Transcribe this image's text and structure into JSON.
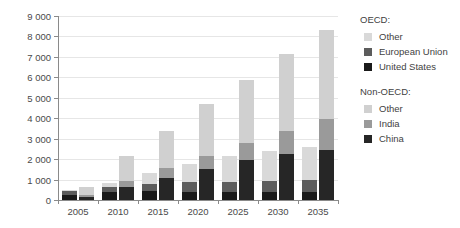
{
  "chart_data": {
    "type": "bar",
    "subtype": "stacked-grouped",
    "title": "",
    "xlabel": "",
    "ylabel": "Billion tonne-km",
    "categories": [
      "2005",
      "2010",
      "2015",
      "2020",
      "2025",
      "2030",
      "2035"
    ],
    "ylim": [
      0,
      9000
    ],
    "ytick_step": 1000,
    "yticks": [
      0,
      1000,
      2000,
      3000,
      4000,
      5000,
      6000,
      7000,
      8000,
      9000
    ],
    "ytick_labels": [
      "0",
      "1 000",
      "2 000",
      "3 000",
      "4 000",
      "5 000",
      "6 000",
      "7 000",
      "8 000",
      "9 000"
    ],
    "grid": true,
    "legend_position": "right",
    "groups": [
      {
        "name": "OECD",
        "bar_position": "left",
        "series": [
          {
            "name": "United States",
            "color": "#1a1a1a",
            "values": [
              260,
              370,
              420,
              380,
              380,
              390,
              400
            ]
          },
          {
            "name": "European Union",
            "color": "#5c5c5c",
            "values": [
              430,
              650,
              800,
              860,
              900,
              950,
              1000
            ]
          },
          {
            "name": "Other",
            "color": "#d9d9d9",
            "values": [
              480,
              840,
              1300,
              1750,
              2130,
              2380,
              2600
            ]
          }
        ]
      },
      {
        "name": "Non-OECD",
        "bar_position": "right",
        "series": [
          {
            "name": "China",
            "color": "#262626",
            "values": [
              160,
              620,
              1080,
              1510,
              1950,
              2230,
              2450
            ]
          },
          {
            "name": "India",
            "color": "#9a9a9a",
            "values": [
              230,
              950,
              1580,
              2130,
              2800,
              3400,
              3950
            ]
          },
          {
            "name": "Other",
            "color": "#d0d0d0",
            "values": [
              640,
              2170,
              3400,
              4680,
              5880,
              7150,
              8300
            ]
          }
        ]
      }
    ],
    "legend": {
      "oecd_heading": "OECD:",
      "oecd_entries": [
        {
          "label": "Other",
          "color": "#d9d9d9"
        },
        {
          "label": "European Union",
          "color": "#5c5c5c"
        },
        {
          "label": "United States",
          "color": "#1a1a1a"
        }
      ],
      "nonoecd_heading": "Non-OECD:",
      "nonoecd_entries": [
        {
          "label": "Other",
          "color": "#d0d0d0"
        },
        {
          "label": "India",
          "color": "#9a9a9a"
        },
        {
          "label": "China",
          "color": "#262626"
        }
      ]
    }
  }
}
